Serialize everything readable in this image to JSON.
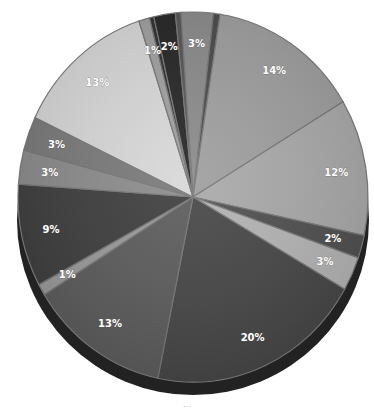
{
  "chart_data": {
    "type": "pie",
    "style": "3d-exploded-grayscale",
    "title": "",
    "start_angle_deg": -94,
    "direction": "clockwise",
    "slices": [
      {
        "label": "3%",
        "value": 3,
        "color": "#8a8a8a"
      },
      {
        "label": "",
        "value": 0.6,
        "color": "#4a4a4a"
      },
      {
        "label": "14%",
        "value": 14,
        "color": "#9e9e9e"
      },
      {
        "label": "12%",
        "value": 12,
        "color": "#a9a9a9"
      },
      {
        "label": "2%",
        "value": 2,
        "color": "#4f4f4f"
      },
      {
        "label": "3%",
        "value": 3,
        "color": "#b4b4b4"
      },
      {
        "label": "20%",
        "value": 20,
        "color": "#464646"
      },
      {
        "label": "13%",
        "value": 13,
        "color": "#5c5c5c"
      },
      {
        "label": "1%",
        "value": 1,
        "color": "#9a9a9a"
      },
      {
        "label": "9%",
        "value": 9,
        "color": "#3e3e3e"
      },
      {
        "label": "3%",
        "value": 3,
        "color": "#8c8c8c"
      },
      {
        "label": "3%",
        "value": 3,
        "color": "#7a7a7a"
      },
      {
        "label": "13%",
        "value": 13,
        "color": "#d8d8d8"
      },
      {
        "label": "1%",
        "value": 1,
        "color": "#a0a0a0"
      },
      {
        "label": "",
        "value": 0.4,
        "color": "#2e2e2e"
      },
      {
        "label": "2%",
        "value": 2,
        "color": "#252525"
      },
      {
        "label": "",
        "value": 0.5,
        "color": "#555555"
      }
    ],
    "legend": "none"
  },
  "caption": "…"
}
